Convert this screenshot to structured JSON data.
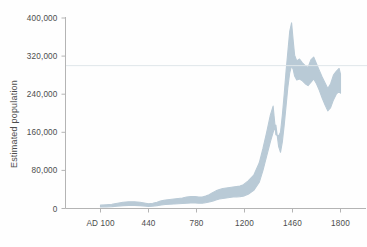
{
  "figure": {
    "background_color": "#fefefe",
    "band_color": "#b9cad6",
    "axis_color": "#b4b4b4",
    "text_color": "#4d4d4d",
    "reference_line_color": "#dfe6ea"
  },
  "axes": {
    "y_title": "Estimated population",
    "y_ticks": [
      "0",
      "80,000",
      "160,000",
      "240,000",
      "320,000",
      "400,000"
    ],
    "x_ticks": [
      "AD 100",
      "440",
      "780",
      "1200",
      "1460",
      "1800"
    ]
  },
  "chart_data": {
    "type": "area",
    "title": "",
    "subtitle": "",
    "xlabel": "",
    "ylabel": "Estimated population",
    "xlim": [
      100,
      1800
    ],
    "ylim": [
      0,
      400000
    ],
    "grid": false,
    "legend_position": "none",
    "y_tick_values": [
      0,
      80000,
      160000,
      240000,
      320000,
      400000
    ],
    "x_tick_values": [
      100,
      440,
      780,
      1200,
      1460,
      1800
    ],
    "x_tick_labels": [
      "AD 100",
      "440",
      "780",
      "1200",
      "1460",
      "1800"
    ],
    "annotations": [
      {
        "type": "horizontal-reference-line",
        "value": 300000,
        "label": ""
      }
    ],
    "series": [
      {
        "name": "Estimated population (uncertainty band)",
        "kind": "band",
        "color": "#b9cad6",
        "x": [
          100,
          140,
          180,
          220,
          260,
          300,
          340,
          380,
          420,
          440,
          470,
          500,
          530,
          560,
          590,
          620,
          650,
          680,
          710,
          740,
          770,
          800,
          830,
          860,
          890,
          920,
          950,
          980,
          1010,
          1040,
          1070,
          1100,
          1130,
          1160,
          1190,
          1220,
          1250,
          1280,
          1300,
          1320,
          1340,
          1355,
          1370,
          1385,
          1395,
          1405,
          1415,
          1425,
          1435,
          1445,
          1455,
          1465,
          1475,
          1490,
          1510,
          1530,
          1550,
          1570,
          1590,
          1610,
          1630,
          1650,
          1670,
          1690,
          1710,
          1730,
          1750,
          1770,
          1790,
          1800
        ],
        "lower": [
          3000,
          3500,
          4000,
          5000,
          6000,
          6500,
          6500,
          6000,
          5000,
          4500,
          5000,
          6000,
          7500,
          8500,
          9000,
          9500,
          10000,
          10500,
          11000,
          11500,
          11500,
          11000,
          11000,
          12000,
          13500,
          15500,
          18000,
          20000,
          21000,
          22000,
          23000,
          24000,
          24500,
          25000,
          26000,
          30000,
          38000,
          55000,
          80000,
          110000,
          140000,
          160000,
          175000,
          130000,
          118000,
          140000,
          175000,
          215000,
          255000,
          285000,
          300000,
          292000,
          278000,
          270000,
          272000,
          268000,
          262000,
          258000,
          265000,
          272000,
          262000,
          248000,
          232000,
          218000,
          205000,
          212000,
          228000,
          240000,
          246000,
          242000
        ],
        "upper": [
          7000,
          8000,
          9000,
          11000,
          13000,
          14000,
          14000,
          13000,
          11000,
          10000,
          11000,
          13000,
          16000,
          18000,
          19000,
          20000,
          21000,
          22000,
          24000,
          25000,
          25000,
          24000,
          24000,
          26000,
          29000,
          33000,
          37000,
          40000,
          42000,
          43000,
          44000,
          45000,
          46000,
          47000,
          50000,
          58000,
          70000,
          96000,
          126000,
          160000,
          196000,
          215000,
          155000,
          152000,
          160000,
          196000,
          240000,
          288000,
          330000,
          372000,
          390000,
          352000,
          322000,
          310000,
          314000,
          306000,
          300000,
          296000,
          312000,
          318000,
          304000,
          290000,
          276000,
          264000,
          252000,
          262000,
          280000,
          288000,
          294000,
          282000
        ]
      }
    ]
  }
}
